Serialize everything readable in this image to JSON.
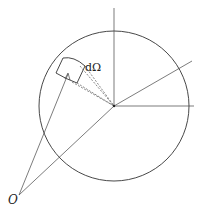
{
  "diagram": {
    "type": "solid-angle-sphere",
    "labels": {
      "solid_angle": "dΩ",
      "origin": "O"
    },
    "colors": {
      "stroke": "#333333",
      "dashed": "#555555",
      "background": "#ffffff"
    },
    "geometry": {
      "circle_center": [
        114,
        106
      ],
      "circle_radius": 75,
      "origin_point": [
        19,
        195
      ]
    }
  }
}
